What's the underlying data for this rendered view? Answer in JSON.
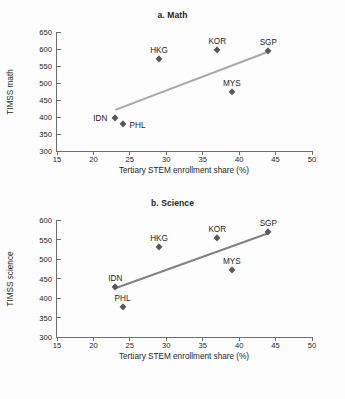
{
  "figure": {
    "shared_xlabel": "Tertiary STEM enrollment share (%)"
  },
  "chart_data": [
    {
      "type": "scatter",
      "panel_id": "a",
      "title": "a. Math",
      "xlabel": "Tertiary STEM enrollment share (%)",
      "ylabel": "TIMSS math",
      "xlim": [
        15,
        50
      ],
      "ylim": [
        300,
        650
      ],
      "xticks": [
        15,
        20,
        25,
        30,
        35,
        40,
        45,
        50
      ],
      "yticks": [
        300,
        350,
        400,
        450,
        500,
        550,
        600,
        650
      ],
      "grid": false,
      "legend": "none",
      "marker_color": "#58585b",
      "trendline_color": "#a7a9ac",
      "points": [
        {
          "label": "IDN",
          "x": 23,
          "y": 397,
          "label_pos": "left"
        },
        {
          "label": "PHL",
          "x": 24,
          "y": 378,
          "label_pos": "right"
        },
        {
          "label": "HKG",
          "x": 29,
          "y": 572,
          "label_pos": "above"
        },
        {
          "label": "KOR",
          "x": 37,
          "y": 598,
          "label_pos": "above"
        },
        {
          "label": "MYS",
          "x": 39,
          "y": 474,
          "label_pos": "above"
        },
        {
          "label": "SGP",
          "x": 44,
          "y": 593,
          "label_pos": "above"
        }
      ],
      "trendline": {
        "x1": 23,
        "y1": 421,
        "x2": 44,
        "y2": 592
      }
    },
    {
      "type": "scatter",
      "panel_id": "b",
      "title": "b. Science",
      "xlabel": "Tertiary STEM enrollment share (%)",
      "ylabel": "TIMSS science",
      "xlim": [
        15,
        50
      ],
      "ylim": [
        300,
        600
      ],
      "xticks": [
        15,
        20,
        25,
        30,
        35,
        40,
        45,
        50
      ],
      "yticks": [
        300,
        350,
        400,
        450,
        500,
        550,
        600
      ],
      "grid": false,
      "legend": "none",
      "marker_color": "#58585b",
      "trendline_color": "#808285",
      "points": [
        {
          "label": "IDN",
          "x": 23,
          "y": 427,
          "label_pos": "above"
        },
        {
          "label": "PHL",
          "x": 24,
          "y": 377,
          "label_pos": "above"
        },
        {
          "label": "HKG",
          "x": 29,
          "y": 530,
          "label_pos": "above"
        },
        {
          "label": "KOR",
          "x": 37,
          "y": 554,
          "label_pos": "above"
        },
        {
          "label": "MYS",
          "x": 39,
          "y": 471,
          "label_pos": "above"
        },
        {
          "label": "SGP",
          "x": 44,
          "y": 568,
          "label_pos": "above"
        }
      ],
      "trendline": {
        "x1": 23,
        "y1": 425,
        "x2": 44,
        "y2": 566
      }
    }
  ]
}
